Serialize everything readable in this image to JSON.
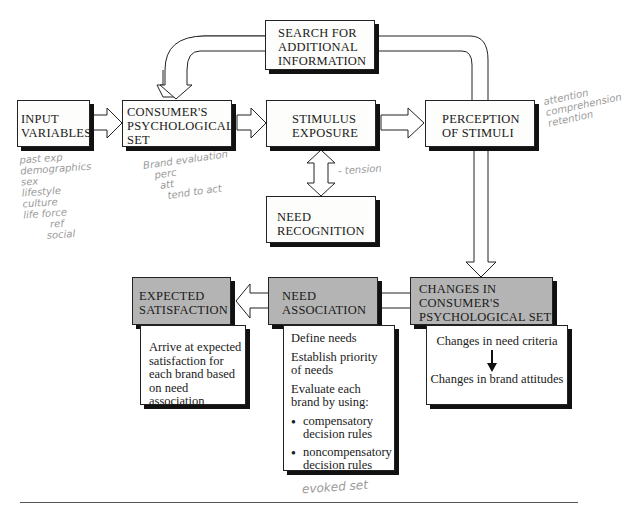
{
  "diagram": {
    "boxes": {
      "search": {
        "lines": [
          "SEARCH FOR",
          "ADDITIONAL",
          "INFORMATION"
        ]
      },
      "input": {
        "lines": [
          "INPUT",
          "VARIABLES"
        ]
      },
      "psych_set": {
        "lines": [
          "CONSUMER'S",
          "PSYCHOLOGICAL",
          "SET"
        ]
      },
      "stimulus": {
        "lines": [
          "STIMULUS",
          "EXPOSURE"
        ]
      },
      "perception": {
        "lines": [
          "PERCEPTION",
          "OF STIMULI"
        ]
      },
      "need_recognition": {
        "lines": [
          "NEED",
          "RECOGNITION"
        ]
      },
      "changes": {
        "lines": [
          "CHANGES IN",
          "CONSUMER'S",
          "PSYCHOLOGICAL SET"
        ]
      },
      "need_association": {
        "lines": [
          "NEED",
          "ASSOCIATION"
        ]
      },
      "expected": {
        "lines": [
          "EXPECTED",
          "SATISFACTION"
        ]
      }
    },
    "details": {
      "expected": {
        "lines": [
          "Arrive at expected",
          "satisfaction for",
          "each brand based",
          "on need association"
        ]
      },
      "need_association": {
        "items": [
          "Define needs",
          "Establish priority of needs",
          "Evaluate each brand by using:"
        ],
        "bullets": [
          "compensatory decision rules",
          "noncompensatory decision rules"
        ]
      },
      "changes": {
        "top": "Changes in need criteria",
        "bottom": "Changes in brand attitudes"
      }
    },
    "colors": {
      "shaded": "#b4b4b4",
      "border": "#222222",
      "shadow": "#111111",
      "handwriting": "#9a9a9a"
    }
  },
  "handwriting": {
    "input_notes": [
      "past exp",
      "demographics",
      "sex",
      "lifestyle",
      "culture",
      "life force",
      "ref",
      "social"
    ],
    "psych_notes": [
      "Brand evaluation",
      "perc",
      "att",
      "tend to act"
    ],
    "perception_notes": [
      "attention",
      "comprehension",
      "retention"
    ],
    "tension": "- tension",
    "evoked": "evoked set"
  }
}
